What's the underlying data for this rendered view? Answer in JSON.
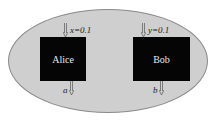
{
  "diagram": {
    "container": {
      "shape": "ellipse",
      "fill": "#cfcfcf",
      "stroke": "#8a8a8a"
    },
    "parties": [
      {
        "name": "Alice",
        "input_label": "x=0.1",
        "output_label": "a",
        "fill": "#050505",
        "text_color": "#e8e8e8"
      },
      {
        "name": "Bob",
        "input_label": "y=0.1",
        "output_label": "b",
        "fill": "#050505",
        "text_color": "#e8e8e8"
      }
    ],
    "arrow_color": "#666666"
  }
}
